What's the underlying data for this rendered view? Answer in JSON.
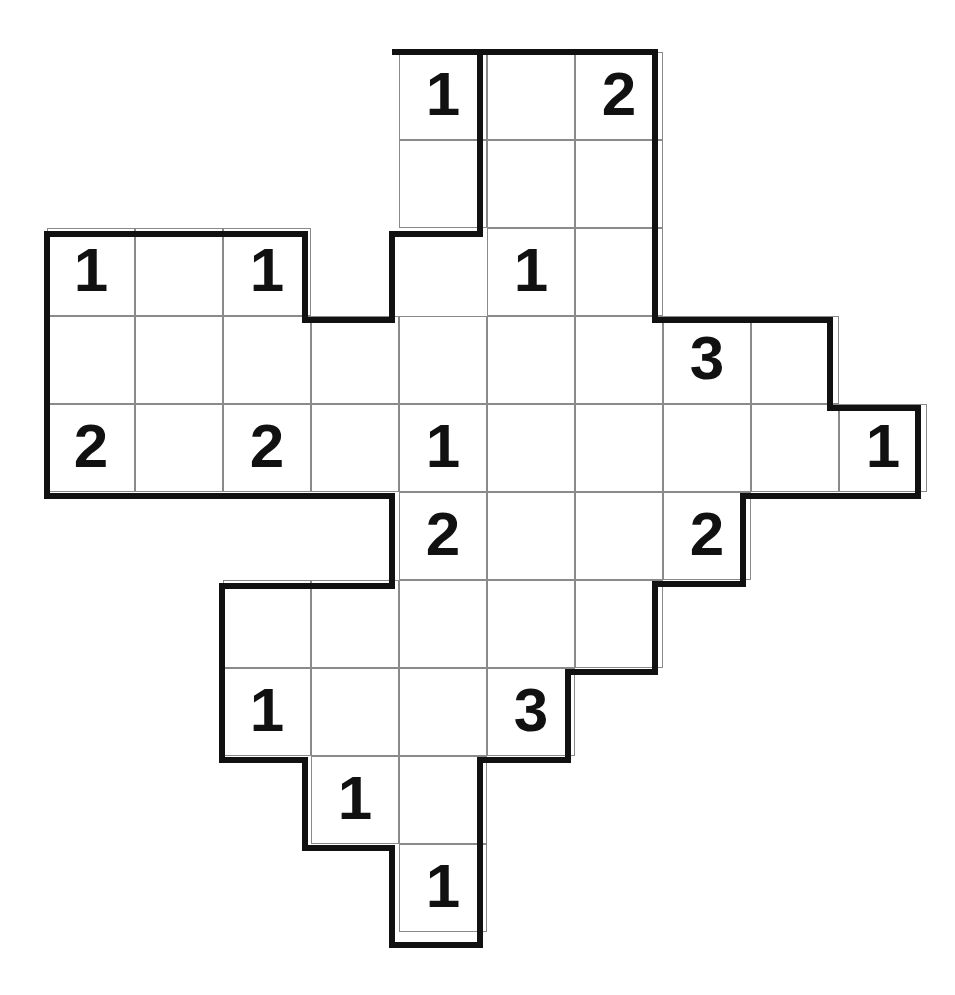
{
  "puzzle": {
    "title": "Number Grid Puzzle",
    "grid": {
      "origin_x": 47,
      "origin_y": 52,
      "cell_size": 88,
      "columns": 10,
      "rows": 10,
      "line_color": "#8a8a8a",
      "border_color": "#111111",
      "background_color": "#ffffff",
      "number_color": "#111111"
    },
    "cells": [
      {
        "col": 4,
        "row": 0,
        "value": "1"
      },
      {
        "col": 5,
        "row": 0,
        "value": ""
      },
      {
        "col": 6,
        "row": 0,
        "value": "2"
      },
      {
        "col": 4,
        "row": 1,
        "value": ""
      },
      {
        "col": 5,
        "row": 1,
        "value": ""
      },
      {
        "col": 6,
        "row": 1,
        "value": ""
      },
      {
        "col": 0,
        "row": 2,
        "value": "1"
      },
      {
        "col": 1,
        "row": 2,
        "value": ""
      },
      {
        "col": 2,
        "row": 2,
        "value": "1"
      },
      {
        "col": 5,
        "row": 2,
        "value": "1"
      },
      {
        "col": 6,
        "row": 2,
        "value": ""
      },
      {
        "col": 0,
        "row": 3,
        "value": ""
      },
      {
        "col": 1,
        "row": 3,
        "value": ""
      },
      {
        "col": 2,
        "row": 3,
        "value": ""
      },
      {
        "col": 3,
        "row": 3,
        "value": ""
      },
      {
        "col": 4,
        "row": 3,
        "value": ""
      },
      {
        "col": 5,
        "row": 3,
        "value": ""
      },
      {
        "col": 6,
        "row": 3,
        "value": ""
      },
      {
        "col": 7,
        "row": 3,
        "value": "3"
      },
      {
        "col": 8,
        "row": 3,
        "value": ""
      },
      {
        "col": 0,
        "row": 4,
        "value": "2"
      },
      {
        "col": 1,
        "row": 4,
        "value": ""
      },
      {
        "col": 2,
        "row": 4,
        "value": "2"
      },
      {
        "col": 3,
        "row": 4,
        "value": ""
      },
      {
        "col": 4,
        "row": 4,
        "value": "1"
      },
      {
        "col": 5,
        "row": 4,
        "value": ""
      },
      {
        "col": 6,
        "row": 4,
        "value": ""
      },
      {
        "col": 7,
        "row": 4,
        "value": ""
      },
      {
        "col": 8,
        "row": 4,
        "value": ""
      },
      {
        "col": 9,
        "row": 4,
        "value": "1"
      },
      {
        "col": 4,
        "row": 5,
        "value": "2"
      },
      {
        "col": 5,
        "row": 5,
        "value": ""
      },
      {
        "col": 6,
        "row": 5,
        "value": ""
      },
      {
        "col": 7,
        "row": 5,
        "value": "2"
      },
      {
        "col": 2,
        "row": 6,
        "value": ""
      },
      {
        "col": 3,
        "row": 6,
        "value": ""
      },
      {
        "col": 4,
        "row": 6,
        "value": ""
      },
      {
        "col": 5,
        "row": 6,
        "value": ""
      },
      {
        "col": 6,
        "row": 6,
        "value": ""
      },
      {
        "col": 2,
        "row": 7,
        "value": "1"
      },
      {
        "col": 3,
        "row": 7,
        "value": ""
      },
      {
        "col": 4,
        "row": 7,
        "value": ""
      },
      {
        "col": 5,
        "row": 7,
        "value": "3"
      },
      {
        "col": 3,
        "row": 8,
        "value": "1"
      },
      {
        "col": 4,
        "row": 8,
        "value": ""
      },
      {
        "col": 4,
        "row": 9,
        "value": "1"
      }
    ],
    "clues": [
      {
        "value": "1",
        "col": 4,
        "row": 0
      },
      {
        "value": "2",
        "col": 6,
        "row": 0
      },
      {
        "value": "1",
        "col": 0,
        "row": 2
      },
      {
        "value": "1",
        "col": 2,
        "row": 2
      },
      {
        "value": "1",
        "col": 5,
        "row": 2
      },
      {
        "value": "3",
        "col": 7,
        "row": 3
      },
      {
        "value": "2",
        "col": 0,
        "row": 4
      },
      {
        "value": "2",
        "col": 2,
        "row": 4
      },
      {
        "value": "1",
        "col": 4,
        "row": 4
      },
      {
        "value": "1",
        "col": 9,
        "row": 4
      },
      {
        "value": "2",
        "col": 4,
        "row": 5
      },
      {
        "value": "2",
        "col": 7,
        "row": 5
      },
      {
        "value": "1",
        "col": 2,
        "row": 7
      },
      {
        "value": "3",
        "col": 5,
        "row": 7
      },
      {
        "value": "1",
        "col": 3,
        "row": 8
      },
      {
        "value": "1",
        "col": 4,
        "row": 9
      }
    ],
    "outline_paths": [
      "M 392 52 L 655 52 L 655 320 L 830 320 L 830 408 L 918 408 L 918 496 L 743 496 L 743 584 L 655 584 L 655 672 L 568 672 L 568 760 L 480 760 L 480 848 L 480 945 L 392 945 L 392 848 L 305 848 L 305 760 L 222 760 L 222 586 L 392 586 L 392 496 L 47 496 L 47 234 L 305 234 L 305 320 L 392 320 L 392 234 L 480 234 L 480 52 Z"
    ]
  }
}
